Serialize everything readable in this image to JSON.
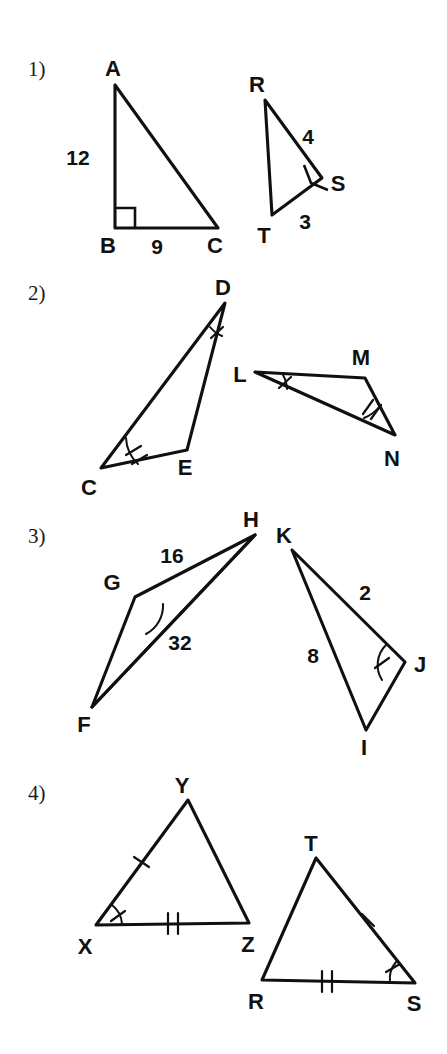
{
  "worksheet": {
    "title": "Congruent Triangles Worksheet",
    "background_color": "#ffffff",
    "ink_color": "#101010"
  },
  "problems": [
    {
      "number": "1)",
      "figures": [
        {
          "name": "triangle-abc",
          "vertices": [
            {
              "label": "A",
              "x": 115,
              "y": 85,
              "lx": 113,
              "ly": 76
            },
            {
              "label": "B",
              "x": 115,
              "y": 228,
              "lx": 108,
              "ly": 253
            },
            {
              "label": "C",
              "x": 218,
              "y": 228,
              "lx": 215,
              "ly": 253
            }
          ],
          "side_labels": [
            {
              "text": "12",
              "x": 78,
              "y": 165
            },
            {
              "text": "9",
              "x": 157,
              "y": 254
            }
          ],
          "right_angle_at": "B"
        },
        {
          "name": "triangle-rst",
          "vertices": [
            {
              "label": "R",
              "x": 265,
              "y": 100,
              "lx": 257,
              "ly": 92
            },
            {
              "label": "S",
              "x": 322,
              "y": 178,
              "lx": 332,
              "ly": 189
            },
            {
              "label": "T",
              "x": 272,
              "y": 215,
              "lx": 262,
              "ly": 243
            }
          ],
          "side_labels": [
            {
              "text": "4",
              "x": 308,
              "y": 144
            },
            {
              "text": "3",
              "x": 305,
              "y": 229
            }
          ],
          "right_angle_at": "S"
        }
      ]
    },
    {
      "number": "2)",
      "figures": [
        {
          "name": "triangle-cde",
          "vertices": [
            {
              "label": "D",
              "x": 225,
              "y": 303,
              "lx": 223,
              "ly": 295
            },
            {
              "label": "C",
              "x": 101,
              "y": 468,
              "lx": 89,
              "ly": 492
            },
            {
              "label": "E",
              "x": 187,
              "y": 450,
              "lx": 185,
              "ly": 473
            }
          ],
          "angle_marks": [
            {
              "at": "D",
              "ticks": 1
            },
            {
              "at": "C",
              "ticks": 2
            }
          ]
        },
        {
          "name": "triangle-lmn",
          "vertices": [
            {
              "label": "L",
              "x": 255,
              "y": 372,
              "lx": 238,
              "ly": 380
            },
            {
              "label": "M",
              "x": 365,
              "y": 378,
              "lx": 358,
              "ly": 363
            },
            {
              "label": "N",
              "x": 395,
              "y": 435,
              "lx": 390,
              "ly": 464
            }
          ],
          "angle_marks": [
            {
              "at": "L",
              "ticks": 1
            },
            {
              "at": "N",
              "ticks": 2
            }
          ]
        }
      ]
    },
    {
      "number": "3)",
      "figures": [
        {
          "name": "triangle-fgh",
          "vertices": [
            {
              "label": "H",
              "x": 255,
              "y": 535,
              "lx": 251,
              "ly": 527
            },
            {
              "label": "G",
              "x": 135,
              "y": 597,
              "lx": 112,
              "ly": 588
            },
            {
              "label": "F",
              "x": 92,
              "y": 707,
              "lx": 84,
              "ly": 730
            }
          ],
          "side_labels": [
            {
              "text": "16",
              "x": 172,
              "y": 562
            },
            {
              "text": "32",
              "x": 178,
              "y": 645
            }
          ],
          "angle_marks": [
            {
              "at": "G",
              "ticks": 0
            }
          ]
        },
        {
          "name": "triangle-ijk",
          "vertices": [
            {
              "label": "K",
              "x": 292,
              "y": 550,
              "lx": 283,
              "ly": 543
            },
            {
              "label": "J",
              "x": 405,
              "y": 662,
              "lx": 414,
              "ly": 670
            },
            {
              "label": "I",
              "x": 366,
              "y": 730,
              "lx": 362,
              "ly": 753
            }
          ],
          "side_labels": [
            {
              "text": "2",
              "x": 363,
              "y": 598
            },
            {
              "text": "8",
              "x": 312,
              "y": 660
            }
          ],
          "angle_marks": [
            {
              "at": "J",
              "ticks": 1
            }
          ]
        }
      ]
    },
    {
      "number": "4)",
      "figures": [
        {
          "name": "triangle-xyz",
          "vertices": [
            {
              "label": "Y",
              "x": 188,
              "y": 800,
              "lx": 181,
              "ly": 791
            },
            {
              "label": "X",
              "x": 96,
              "y": 925,
              "lx": 85,
              "ly": 951
            },
            {
              "label": "Z",
              "x": 249,
              "y": 923,
              "lx": 246,
              "ly": 950
            }
          ],
          "side_marks": [
            {
              "side": "XY",
              "ticks": 1
            },
            {
              "side": "XZ",
              "ticks": 2
            }
          ],
          "angle_marks": [
            {
              "at": "X",
              "ticks": 1
            }
          ]
        },
        {
          "name": "triangle-rst-2",
          "vertices": [
            {
              "label": "T",
              "x": 316,
              "y": 858,
              "lx": 309,
              "ly": 850
            },
            {
              "label": "R",
              "x": 262,
              "y": 980,
              "lx": 254,
              "ly": 1006
            },
            {
              "label": "S",
              "x": 415,
              "y": 983,
              "lx": 411,
              "ly": 1008
            }
          ],
          "side_marks": [
            {
              "side": "TS",
              "ticks": 1
            },
            {
              "side": "RS",
              "ticks": 2
            }
          ],
          "angle_marks": [
            {
              "at": "S",
              "ticks": 1
            }
          ]
        }
      ]
    }
  ]
}
